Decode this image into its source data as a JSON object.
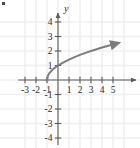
{
  "figure": {
    "corner_mark": "•",
    "background_color": "#ffffff",
    "grid_color": "#f0f0f0",
    "axis_color": "#5a5a5a",
    "curve_color": "#7d7d7d",
    "label_color": "#2b2b2b"
  },
  "chart_data": {
    "type": "line",
    "title": "",
    "subtitle": "",
    "xlabel": "",
    "ylabel": "y",
    "axis_labels": {
      "x": "",
      "y": "y"
    },
    "xlim": [
      -3.8,
      6.0
    ],
    "ylim": [
      -4.7,
      4.6
    ],
    "x_ticks": [
      -3,
      -2,
      -1,
      1,
      2,
      3,
      4,
      5
    ],
    "y_ticks": [
      -4,
      -3,
      -2,
      -1,
      1,
      2,
      3,
      4
    ],
    "x_tick_labels": [
      "-3",
      "-2",
      "-1",
      "1",
      "2",
      "3",
      "4",
      "5"
    ],
    "y_tick_labels": [
      "-4",
      "-3",
      "-2",
      "-1",
      "1",
      "2",
      "3",
      "4"
    ],
    "grid": true,
    "grid_spacing": 1,
    "legend": null,
    "annotations": [],
    "series": [
      {
        "name": "y = sqrt(x + 1)",
        "equation": "y = √(x + 1)",
        "color": "#7d7d7d",
        "arrow_end": true,
        "domain_start": -1,
        "domain_end": 5.5,
        "points": [
          {
            "x": -1.0,
            "y": 0.0
          },
          {
            "x": -0.9,
            "y": 0.32
          },
          {
            "x": -0.8,
            "y": 0.45
          },
          {
            "x": -0.7,
            "y": 0.55
          },
          {
            "x": -0.6,
            "y": 0.63
          },
          {
            "x": -0.5,
            "y": 0.71
          },
          {
            "x": -0.4,
            "y": 0.77
          },
          {
            "x": -0.3,
            "y": 0.84
          },
          {
            "x": -0.2,
            "y": 0.89
          },
          {
            "x": -0.1,
            "y": 0.95
          },
          {
            "x": 0.0,
            "y": 1.0
          },
          {
            "x": 0.5,
            "y": 1.22
          },
          {
            "x": 1.0,
            "y": 1.41
          },
          {
            "x": 1.5,
            "y": 1.58
          },
          {
            "x": 2.0,
            "y": 1.73
          },
          {
            "x": 2.5,
            "y": 1.87
          },
          {
            "x": 3.0,
            "y": 2.0
          },
          {
            "x": 3.5,
            "y": 2.12
          },
          {
            "x": 4.0,
            "y": 2.24
          },
          {
            "x": 4.5,
            "y": 2.35
          },
          {
            "x": 5.0,
            "y": 2.45
          },
          {
            "x": 5.5,
            "y": 2.55
          }
        ]
      }
    ]
  }
}
